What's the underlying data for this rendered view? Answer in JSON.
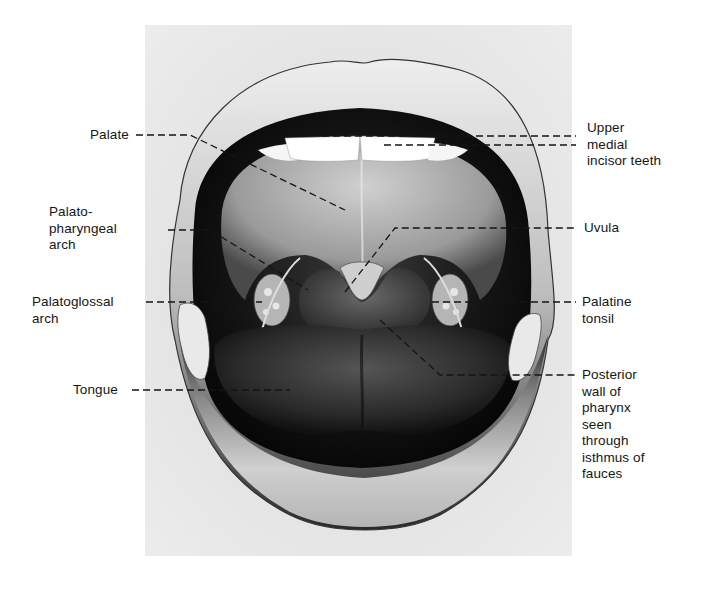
{
  "figure": {
    "background_box_color": "#e4e4e4",
    "ink_color": "#111111"
  },
  "labels": {
    "left": [
      {
        "id": "palate",
        "text": "Palate"
      },
      {
        "id": "palatopharyngeal-arch",
        "text": "Palato-\npharyngeal\narch"
      },
      {
        "id": "palatoglossal-arch",
        "text": "Palatoglossal\narch"
      },
      {
        "id": "tongue",
        "text": "Tongue"
      }
    ],
    "right": [
      {
        "id": "upper-medial-incisor-teeth",
        "text": "Upper\nmedial\nincisor teeth"
      },
      {
        "id": "uvula",
        "text": "Uvula"
      },
      {
        "id": "palatine-tonsil",
        "text": "Palatine\ntonsil"
      },
      {
        "id": "posterior-wall-of-pharynx",
        "text": "Posterior\nwall of\npharynx\nseen\nthrough\nisthmus of\nfauces"
      }
    ]
  }
}
